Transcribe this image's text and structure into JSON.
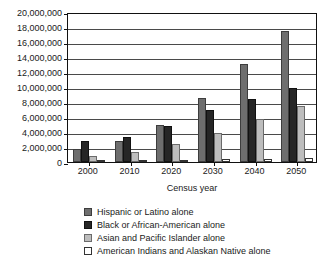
{
  "chart_data": {
    "type": "bar",
    "title": "",
    "subtitle": "",
    "xlabel": "Census year",
    "ylabel": "",
    "grid": true,
    "legend_position": "bottom",
    "orientation": "vertical",
    "grouping": "grouped",
    "ylim": [
      0,
      20000000
    ],
    "ytick_step": 2000000,
    "categories": [
      "2000",
      "2010",
      "2020",
      "2030",
      "2040",
      "2050"
    ],
    "ytick_labels": [
      "20,000,000",
      "18,000,000",
      "16,000,000",
      "14,000,000",
      "12,000,000",
      "10,000,000",
      "8,000,000",
      "6,000,000",
      "4,000,000",
      "2,000,000",
      "0"
    ],
    "ytick_values": [
      20000000,
      18000000,
      16000000,
      14000000,
      12000000,
      10000000,
      8000000,
      6000000,
      4000000,
      2000000,
      0
    ],
    "series": [
      {
        "name": "Hispanic or Latino alone",
        "color": "#6e6e6e",
        "values": [
          1700000,
          2800000,
          4900000,
          8500000,
          13100000,
          17500000
        ]
      },
      {
        "name": "Black or African-American alone",
        "color": "#262626",
        "values": [
          2800000,
          3300000,
          4800000,
          7000000,
          8400000,
          9900000
        ]
      },
      {
        "name": "Asian and Pacific Islander alone",
        "color": "#bdbdbd",
        "values": [
          800000,
          1300000,
          2400000,
          3900000,
          5700000,
          7500000
        ]
      },
      {
        "name": "American Indians and Alaskan Native alone",
        "color": "#ffffff",
        "values": [
          150000,
          200000,
          250000,
          400000,
          450000,
          500000
        ]
      }
    ]
  },
  "axis": {
    "x_title": "Census year"
  },
  "legend": {
    "entries": [
      {
        "label": "Hispanic or Latino alone",
        "color": "#6e6e6e"
      },
      {
        "label": "Black or African-American alone",
        "color": "#262626"
      },
      {
        "label": "Asian and Pacific Islander alone",
        "color": "#bdbdbd"
      },
      {
        "label": "American Indians and Alaskan Native alone",
        "color": "#ffffff"
      }
    ]
  }
}
